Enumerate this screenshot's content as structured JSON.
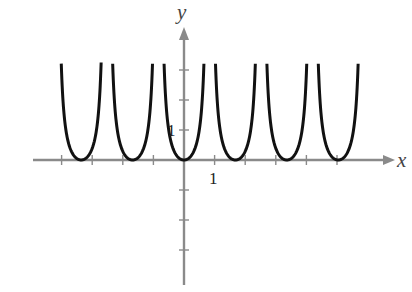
{
  "chart_data": {
    "type": "line",
    "title": "",
    "xlabel": "x",
    "ylabel": "y",
    "x_tick_label": "1",
    "y_tick_label": "1",
    "xlim": [
      -5,
      6.8
    ],
    "ylim": [
      -4.2,
      4.3
    ],
    "grid": false,
    "legend": null,
    "x_ticks": [
      -4,
      -3,
      -2,
      -1,
      1,
      2,
      3,
      4,
      5
    ],
    "y_ticks": [
      -3,
      -2,
      -1,
      1,
      2,
      3
    ],
    "series": [
      {
        "name": "periodic curve",
        "description": "Periodic U-shaped branches touching the x-axis at minima (y=0) with vertical asymptotes between them; period ≈ 1.68 units",
        "period": 1.68,
        "minima_x": [
          -3.36,
          -1.68,
          0,
          1.68,
          3.36,
          5.04
        ],
        "minimum_y": 0,
        "asymptotes_x": [
          -2.52,
          -0.84,
          0.84,
          2.52,
          4.2
        ],
        "x_range": [
          -4.1,
          5.9
        ],
        "y_max_drawn": 3.4
      }
    ],
    "colors": {
      "curve": "#111111",
      "axes": "#8a8a8a"
    }
  }
}
